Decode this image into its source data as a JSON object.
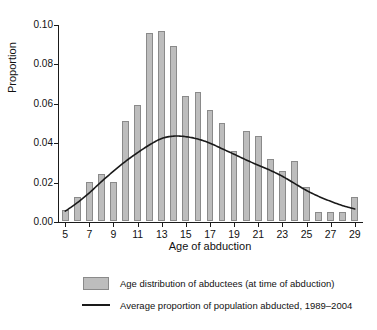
{
  "chart_data": {
    "type": "bar",
    "title": "",
    "xlabel": "Age of abduction",
    "ylabel": "Proportion",
    "xlim": [
      4.4,
      29.6
    ],
    "ylim": [
      0.0,
      0.1
    ],
    "grid": false,
    "legend_position": "below",
    "y_ticks": [
      "0.00",
      "0.02",
      "0.04",
      "0.06",
      "0.08",
      "0.10"
    ],
    "y_tick_values": [
      0.0,
      0.02,
      0.04,
      0.06,
      0.08,
      0.1
    ],
    "x_ticks": [
      "5",
      "7",
      "9",
      "11",
      "13",
      "15",
      "17",
      "19",
      "21",
      "23",
      "25",
      "27",
      "29"
    ],
    "x_tick_values": [
      5,
      7,
      9,
      11,
      13,
      15,
      17,
      19,
      21,
      23,
      25,
      27,
      29
    ],
    "categories": [
      5,
      6,
      7,
      8,
      9,
      10,
      11,
      12,
      13,
      14,
      15,
      16,
      17,
      18,
      19,
      20,
      21,
      22,
      23,
      24,
      25,
      26,
      27,
      28,
      29
    ],
    "series": [
      {
        "name": "Age distribution of abductees (at time of abduction)",
        "type": "bar",
        "color": "#bdbdbd",
        "edge_color": "#8a8a8a",
        "values": [
          0.0058,
          0.0123,
          0.02,
          0.024,
          0.02,
          0.051,
          0.059,
          0.0956,
          0.0967,
          0.0888,
          0.0636,
          0.0655,
          0.0566,
          0.0497,
          0.0354,
          0.0455,
          0.0434,
          0.0314,
          0.0253,
          0.0305,
          0.0175,
          0.0045,
          0.0045,
          0.0045,
          0.0124
        ]
      },
      {
        "name": "Average proportion of population abducted, 1989–2004",
        "type": "line",
        "color": "#1a1a1a",
        "x": [
          5,
          6,
          7,
          8,
          9,
          10,
          11,
          12,
          13,
          14,
          15,
          16,
          17,
          18,
          19,
          20,
          21,
          22,
          23,
          24,
          25,
          26,
          27,
          28,
          29
        ],
        "values": [
          0.0055,
          0.0098,
          0.0148,
          0.0205,
          0.0258,
          0.0308,
          0.0352,
          0.0392,
          0.0424,
          0.0436,
          0.0433,
          0.0421,
          0.04,
          0.0372,
          0.0344,
          0.0315,
          0.0288,
          0.0262,
          0.0232,
          0.0196,
          0.016,
          0.013,
          0.0105,
          0.0083,
          0.0066
        ]
      }
    ]
  },
  "axes": {
    "x_title": "Age of abduction",
    "y_title": "Proportion"
  },
  "legend": {
    "items": [
      {
        "key": "swatch",
        "label": "Age distribution of abductees (at time of abduction)"
      },
      {
        "key": "line",
        "label": "Average proportion of population abducted, 1989–2004"
      }
    ]
  }
}
